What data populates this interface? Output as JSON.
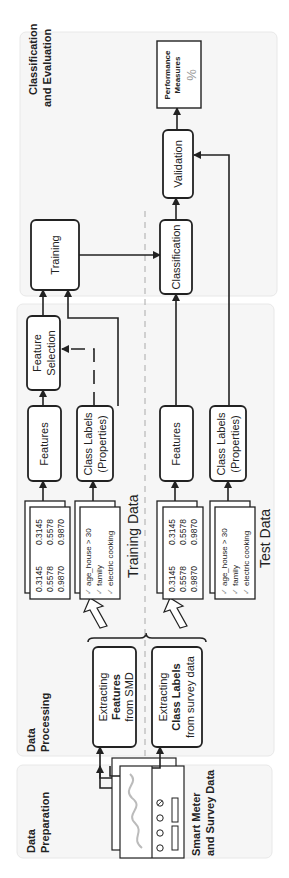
{
  "panels": {
    "preparation": {
      "title_line1": "Data",
      "title_line2": "Preparation",
      "source_label_line1": "Smart Meter",
      "source_label_line2": "and Survey Data"
    },
    "processing": {
      "title_line1": "Data",
      "title_line2": "Processing"
    },
    "evaluation": {
      "title_line1": "Classification",
      "title_line2": "and Evaluation"
    }
  },
  "extract_features": {
    "line1": "Extracting",
    "line2": "Features",
    "line3": "from SMD"
  },
  "extract_labels": {
    "line1": "Extracting",
    "line2": "Class Labels",
    "line3": "from survey data"
  },
  "training_data": {
    "label": "Training Data",
    "features_box": "Features",
    "labels_box_line1": "Class Labels",
    "labels_box_line2": "(Properties)",
    "matrix": [
      [
        "0.3145",
        "0.3145"
      ],
      [
        "0.5578",
        "0.5578"
      ],
      [
        "0.9870",
        "0.9870"
      ]
    ],
    "properties": [
      "age_house > 30",
      "family",
      "electric cooking"
    ]
  },
  "test_data": {
    "label": "Test Data",
    "features_box": "Features",
    "labels_box_line1": "Class Labels",
    "labels_box_line2": "(Properties)",
    "matrix": [
      [
        "0.3145",
        "0.3145"
      ],
      [
        "0.5578",
        "0.5578"
      ],
      [
        "0.9870",
        "0.9870"
      ]
    ],
    "properties": [
      "age_house > 30",
      "family",
      "electric cooking"
    ]
  },
  "feature_selection": {
    "line1": "Feature",
    "line2": "Selection"
  },
  "training": {
    "label": "Training"
  },
  "classification": {
    "label": "Classification"
  },
  "validation": {
    "label": "Validation"
  },
  "performance": {
    "line1": "Performance",
    "line2": "Measures",
    "symbol": "%"
  },
  "icons": {
    "check": "✓"
  }
}
